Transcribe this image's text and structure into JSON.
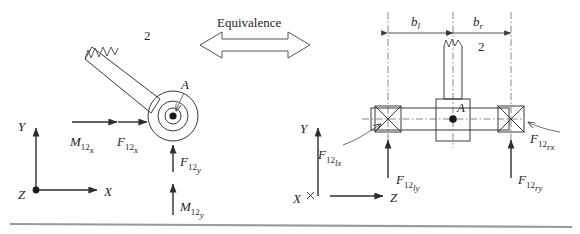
{
  "figure": {
    "center": {
      "equivalence_label": "Equivalence"
    },
    "left_view": {
      "link_number": "2",
      "joint_label": "A",
      "axes": {
        "y": "Y",
        "x": "X",
        "z": "Z"
      },
      "loads": [
        {
          "name": "moment-x",
          "base": "M",
          "sub_num": "12",
          "sub_dir": "x"
        },
        {
          "name": "force-x",
          "base": "F",
          "sub_num": "12",
          "sub_dir": "x"
        },
        {
          "name": "force-y",
          "base": "F",
          "sub_num": "12",
          "sub_dir": "y"
        },
        {
          "name": "moment-y",
          "base": "M",
          "sub_num": "12",
          "sub_dir": "y"
        }
      ]
    },
    "right_view": {
      "link_number": "2",
      "joint_label": "A",
      "axes": {
        "y": "Y",
        "z": "Z",
        "x": "X"
      },
      "dimensions": [
        {
          "name": "b-left",
          "base": "b",
          "sub": "l"
        },
        {
          "name": "b-right",
          "base": "b",
          "sub": "r"
        }
      ],
      "loads": [
        {
          "name": "bearing-left-x",
          "base": "F",
          "sub_num": "12",
          "sub_dir": "lx"
        },
        {
          "name": "bearing-left-y",
          "base": "F",
          "sub_num": "12",
          "sub_dir": "ly"
        },
        {
          "name": "bearing-right-x",
          "base": "F",
          "sub_num": "12",
          "sub_dir": "rx"
        },
        {
          "name": "bearing-right-y",
          "base": "F",
          "sub_num": "12",
          "sub_dir": "ry"
        }
      ]
    },
    "colors": {
      "ink": "#2e2e2e",
      "line": "#3a3a3a",
      "centerline": "#6a6a6a",
      "rule": "#9a9a9a"
    }
  }
}
